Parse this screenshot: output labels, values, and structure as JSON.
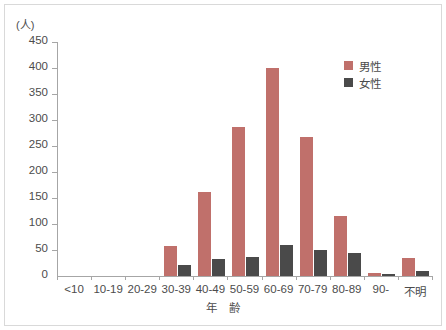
{
  "chart_data": {
    "type": "bar",
    "title": "",
    "subtitle": "",
    "unit_label": "(人)",
    "xlabel": "年　齢",
    "ylabel": "",
    "ylim": [
      0,
      450
    ],
    "ytick_step": 50,
    "grid": false,
    "legend_position": "top-right",
    "categories": [
      "<10",
      "10-19",
      "20-29",
      "30-39",
      "40-49",
      "50-59",
      "60-69",
      "70-79",
      "80-89",
      "90-",
      "不明"
    ],
    "yticks": [
      "0",
      "50",
      "100",
      "150",
      "200",
      "250",
      "300",
      "350",
      "400",
      "450"
    ],
    "ytick_values": [
      0,
      50,
      100,
      150,
      200,
      250,
      300,
      350,
      400,
      450
    ],
    "series": [
      {
        "name": "男性",
        "color": "#c0706b",
        "values": [
          0,
          0,
          0,
          57,
          162,
          287,
          400,
          268,
          115,
          5,
          35
        ]
      },
      {
        "name": "女性",
        "color": "#4a4a4a",
        "values": [
          0,
          0,
          0,
          22,
          33,
          37,
          60,
          50,
          45,
          4,
          10
        ]
      }
    ]
  },
  "legend": {
    "items": [
      {
        "label": "男性",
        "color": "#c0706b"
      },
      {
        "label": "女性",
        "color": "#4a4a4a"
      }
    ]
  },
  "colors": {
    "male": "#c0706b",
    "female": "#4a4a4a",
    "axis": "#a6a6a6",
    "text": "#4c4c4c",
    "frame": "#d9d9d9",
    "background": "#ffffff"
  }
}
